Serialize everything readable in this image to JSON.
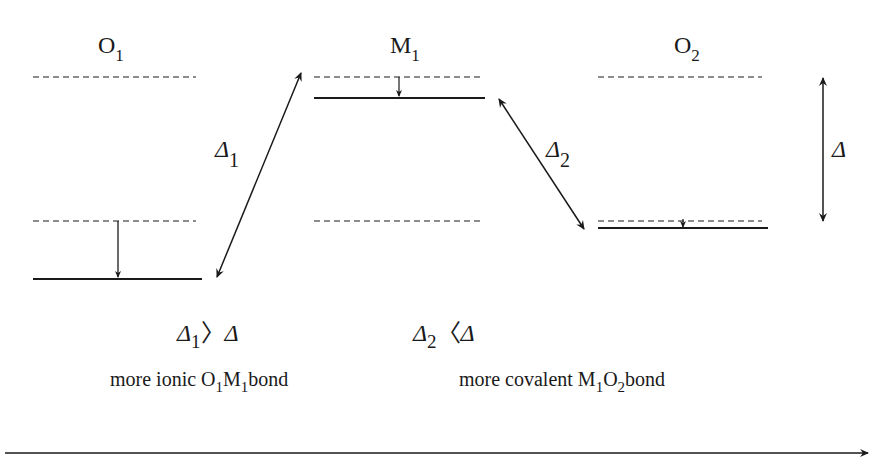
{
  "diagram": {
    "columns": [
      {
        "id": "O1",
        "label": "O",
        "subscript": "1"
      },
      {
        "id": "M1",
        "label": "M",
        "subscript": "1"
      },
      {
        "id": "O2",
        "label": "O",
        "subscript": "2"
      }
    ],
    "gaps": {
      "delta1": {
        "symbol": "Δ",
        "subscript": "1"
      },
      "delta2": {
        "symbol": "Δ",
        "subscript": "2"
      },
      "delta": {
        "symbol": "Δ"
      }
    },
    "relations": [
      {
        "lhs": "Δ",
        "lhs_sub": "1",
        "op": "〉",
        "rhs": "Δ"
      },
      {
        "lhs": "Δ",
        "lhs_sub": "2",
        "op": "〈",
        "rhs": "Δ"
      }
    ],
    "captions": [
      {
        "prefix": "more ionic ",
        "a": "O",
        "a_sub": "1",
        "b": "M",
        "b_sub": "1",
        "suffix": "bond"
      },
      {
        "prefix": "more covalent ",
        "a": "M",
        "a_sub": "1",
        "b": "O",
        "b_sub": "2",
        "suffix": "bond"
      }
    ],
    "colors": {
      "ink": "#1a1a1a",
      "background": "#ffffff"
    }
  }
}
